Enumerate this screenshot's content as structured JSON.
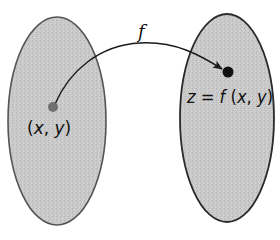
{
  "diagram": {
    "type": "function-mapping",
    "domain_set": {
      "shape": "ellipse",
      "point_label": "(x, y)",
      "point_color": "#707070"
    },
    "codomain_set": {
      "shape": "ellipse",
      "point_label": "z = f (x, y)",
      "point_color": "#111111"
    },
    "mapping": {
      "label": "f",
      "direction": "domain-to-codomain"
    },
    "labels": {
      "f": "f",
      "domain_point": {
        "open": "(",
        "x": "x",
        "sep": ", ",
        "y": "y",
        "close": ")"
      },
      "codomain_point": {
        "z": "z",
        "eq": " = ",
        "f": "f",
        "open": " (",
        "x": "x",
        "sep": ", ",
        "y": "y",
        "close": ")"
      }
    },
    "colors": {
      "fill": "#c8c8c8",
      "domain_stroke": "#555555",
      "codomain_stroke": "#2a2a2a",
      "arrow": "#1a1a1a"
    }
  }
}
